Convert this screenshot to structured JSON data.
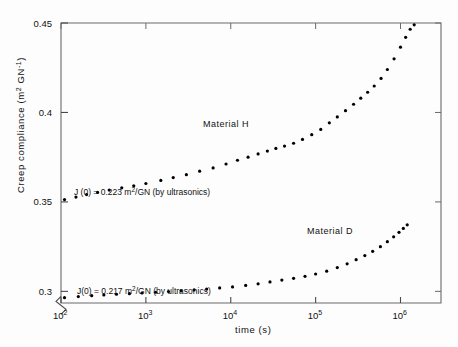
{
  "chart_data": {
    "type": "scatter",
    "title": "",
    "xlabel": "time (s)",
    "ylabel": "Creep compliance (m² GN⁻¹)",
    "xscale": "log",
    "yscale": "linear",
    "xlim": [
      100,
      3000000
    ],
    "ylim": [
      0.2935,
      0.45
    ],
    "grid": false,
    "legend_position": "inline-annotations",
    "xticks": [
      {
        "value": 100,
        "label": "10²",
        "base": "10",
        "exp": "2"
      },
      {
        "value": 1000,
        "label": "10³",
        "base": "10",
        "exp": "3"
      },
      {
        "value": 10000,
        "label": "10⁴",
        "base": "10",
        "exp": "4"
      },
      {
        "value": 100000,
        "label": "10⁵",
        "base": "10",
        "exp": "5"
      },
      {
        "value": 1000000,
        "label": "10⁶",
        "base": "10",
        "exp": "6"
      }
    ],
    "yticks": [
      {
        "value": 0.3,
        "label": "0.3"
      },
      {
        "value": 0.35,
        "label": "0.35"
      },
      {
        "value": 0.4,
        "label": "0.4"
      },
      {
        "value": 0.45,
        "label": "0.45"
      }
    ],
    "y_axis_break": true,
    "series": [
      {
        "name": "Material H",
        "label": "Material  H",
        "marker": "dot",
        "color": "#000000",
        "points": [
          [
            110,
            0.3513
          ],
          [
            150,
            0.3527
          ],
          [
            200,
            0.3541
          ],
          [
            270,
            0.3553
          ],
          [
            370,
            0.3566
          ],
          [
            520,
            0.3579
          ],
          [
            720,
            0.359
          ],
          [
            1000,
            0.3603
          ],
          [
            1500,
            0.362
          ],
          [
            2100,
            0.3636
          ],
          [
            3000,
            0.3652
          ],
          [
            4300,
            0.3672
          ],
          [
            6200,
            0.369
          ],
          [
            8800,
            0.3712
          ],
          [
            12000,
            0.3733
          ],
          [
            16000,
            0.375
          ],
          [
            21000,
            0.3768
          ],
          [
            27000,
            0.3784
          ],
          [
            34000,
            0.3799
          ],
          [
            43000,
            0.3812
          ],
          [
            55000,
            0.3828
          ],
          [
            70000,
            0.3849
          ],
          [
            90000,
            0.3876
          ],
          [
            115000,
            0.3905
          ],
          [
            145000,
            0.3942
          ],
          [
            180000,
            0.3975
          ],
          [
            225000,
            0.401
          ],
          [
            280000,
            0.4046
          ],
          [
            340000,
            0.408
          ],
          [
            410000,
            0.4113
          ],
          [
            490000,
            0.4148
          ],
          [
            590000,
            0.419
          ],
          [
            700000,
            0.424
          ],
          [
            840000,
            0.43
          ],
          [
            1000000,
            0.4365
          ],
          [
            1150000,
            0.442
          ],
          [
            1300000,
            0.4465
          ],
          [
            1450000,
            0.449
          ]
        ]
      },
      {
        "name": "Material D",
        "label": "Material   D",
        "marker": "dot",
        "color": "#000000",
        "points": [
          [
            110,
            0.2965
          ],
          [
            160,
            0.2971
          ],
          [
            230,
            0.2976
          ],
          [
            320,
            0.298
          ],
          [
            450,
            0.2984
          ],
          [
            640,
            0.2987
          ],
          [
            900,
            0.2991
          ],
          [
            1300,
            0.2995
          ],
          [
            1850,
            0.2999
          ],
          [
            2600,
            0.3003
          ],
          [
            3700,
            0.3008
          ],
          [
            5200,
            0.3013
          ],
          [
            7400,
            0.3019
          ],
          [
            10500,
            0.3025
          ],
          [
            15000,
            0.3033
          ],
          [
            21000,
            0.3042
          ],
          [
            29000,
            0.3053
          ],
          [
            40000,
            0.3063
          ],
          [
            55000,
            0.3073
          ],
          [
            75000,
            0.3084
          ],
          [
            100000,
            0.3097
          ],
          [
            135000,
            0.3113
          ],
          [
            180000,
            0.3133
          ],
          [
            235000,
            0.3154
          ],
          [
            300000,
            0.3177
          ],
          [
            380000,
            0.32
          ],
          [
            470000,
            0.3224
          ],
          [
            580000,
            0.325
          ],
          [
            700000,
            0.3278
          ],
          [
            830000,
            0.3305
          ],
          [
            960000,
            0.333
          ],
          [
            1080000,
            0.3352
          ],
          [
            1200000,
            0.3372
          ]
        ]
      }
    ],
    "annotations": [
      {
        "id": "j0-material-h",
        "text": "J (0) = 0.223 m²/GN  (by  ultrasonics)",
        "x_px": 74,
        "y_px": 195
      },
      {
        "id": "j0-material-d",
        "text": "J(0) = 0.217 m²/GN  (by  ultrasonics)",
        "x_px": 77,
        "y_px": 294
      }
    ],
    "series_labels": [
      {
        "id": "material-h-label",
        "text": "Material  H",
        "x_px": 203,
        "y_px": 127
      },
      {
        "id": "material-d-label",
        "text": "Material   D",
        "x_px": 307,
        "y_px": 234
      }
    ]
  }
}
